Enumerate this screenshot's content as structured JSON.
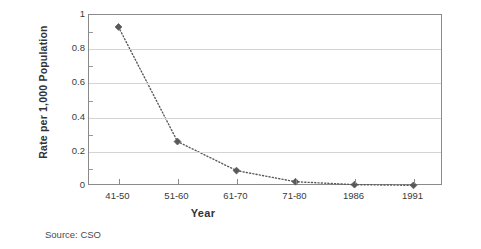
{
  "chart_data": {
    "type": "line",
    "title": "",
    "xlabel": "Year",
    "ylabel": "Rate per 1,000 Population",
    "categories": [
      "41-50",
      "51-60",
      "61-70",
      "71-80",
      "1986",
      "1991"
    ],
    "values": [
      0.93,
      0.26,
      0.09,
      0.025,
      0.008,
      0.004
    ],
    "ylim": [
      0,
      1
    ],
    "yticks": [
      "0",
      "0.2",
      "0.4",
      "0.6",
      "0.8",
      "1"
    ],
    "ytick_values": [
      0,
      0.2,
      0.4,
      0.6,
      0.8,
      1
    ],
    "grid": true,
    "legend": "none",
    "marker": "diamond",
    "line_style": "dotted",
    "series_color": "#595959",
    "grid_color": "#d4d4d4",
    "axis_color": "#8a8a8a"
  },
  "notes": {
    "source": "Source: CSO"
  }
}
